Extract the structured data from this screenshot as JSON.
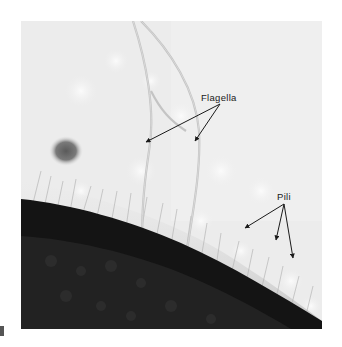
{
  "figure": {
    "type": "electron-micrograph",
    "background_color": "#ffffff",
    "photo_light_color": "#ebebeb",
    "cell_body_color": "#141414",
    "labels": [
      {
        "id": "flagella",
        "text": "Flagella",
        "arrow_count": 2
      },
      {
        "id": "pili",
        "text": "Pili",
        "arrow_count": 3
      }
    ]
  }
}
